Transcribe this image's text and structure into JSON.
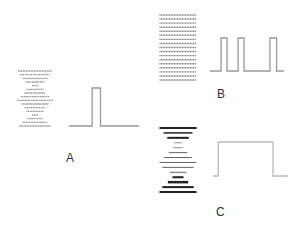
{
  "panels": [
    {
      "label": "A",
      "stack": [
        0.9,
        0.8,
        0.65,
        0.5,
        0.15,
        0.45,
        0.55,
        0.75,
        0.95,
        0.7,
        0.55,
        0.45,
        0.15,
        0.4,
        0.65,
        0.85
      ],
      "stack_color": "#888888",
      "wave": {
        "pulses": [
          [
            0.33,
            0.45
          ]
        ],
        "color": "#999999"
      }
    },
    {
      "label": "B",
      "stack": [
        1,
        1,
        1,
        1,
        1,
        1,
        1,
        1,
        1,
        1,
        1,
        1,
        1,
        1,
        1,
        1,
        1
      ],
      "stack_color": "#777777",
      "wave": {
        "pulses": [
          [
            0.15,
            0.23
          ],
          [
            0.38,
            0.46
          ],
          [
            0.81,
            0.9
          ]
        ],
        "color": "#999999"
      }
    },
    {
      "label": "C",
      "stack": [
        1.0,
        0.78,
        0.58,
        0.2,
        0.25,
        0.5,
        0.75,
        1.0,
        0.85,
        0.45,
        0.3,
        0.55,
        0.85,
        1.0
      ],
      "stack_weights": [
        2,
        1.5,
        2,
        0.5,
        0.5,
        0.7,
        0.7,
        0.7,
        0.7,
        0.7,
        2,
        2.5,
        2,
        2
      ],
      "stack_color": "#222222",
      "wave": {
        "pulses": [
          [
            0.07,
            0.8
          ]
        ],
        "color": "#bbbbbb"
      }
    }
  ]
}
